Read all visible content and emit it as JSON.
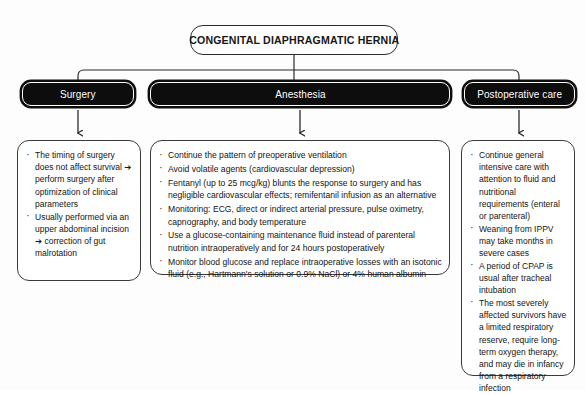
{
  "diagram": {
    "title_node": {
      "label": "CONGENITAL DIAPHRAGMATIC HERNIA"
    },
    "branches": [
      {
        "key": "surgery",
        "header": "Surgery",
        "bullets": [
          "The timing of surgery does not affect survival ➔ perform surgery after optimization of clinical parameters",
          "Usually performed via an upper abdominal incision ➔ correction of gut malrotation"
        ]
      },
      {
        "key": "anesthesia",
        "header": "Anesthesia",
        "bullets": [
          "Continue the pattern of preoperative ventilation",
          "Avoid volatile agents (cardiovascular depression)",
          "Fentanyl (up to 25 mcg/kg) blunts the response to surgery and has negligible cardiovascular effects; remifentanil infusion as an alternative",
          "Monitoring: ECG, direct or indirect arterial pressure, pulse oximetry, capnography, and body temperature",
          "Use a glucose-containing maintenance fluid instead of parenteral nutrition intraoperatively and for 24 hours postoperatively",
          "Monitor blood glucose and replace intraoperative losses with an isotonic fluid (e.g., Hartmann's solution or 0.9% NaCl) or 4% human albumin"
        ]
      },
      {
        "key": "postoperative-care",
        "header": "Postoperative care",
        "bullets": [
          "Continue general intensive care with attention to fluid and nutritional requirements (enteral or parenteral)",
          "Weaning from IPPV may take months in severe cases",
          "A period of CPAP is usual after tracheal intubation",
          "The most severely affected survivors have a limited respiratory reserve, require long-term oxygen therapy, and may die in infancy from a respiratory infection"
        ]
      }
    ],
    "colors": {
      "header_fill": "#0d0d0d",
      "header_text": "#ffffff",
      "border": "#3a3a3a",
      "background": "#fdfdfd",
      "body_text": "#141414"
    }
  }
}
